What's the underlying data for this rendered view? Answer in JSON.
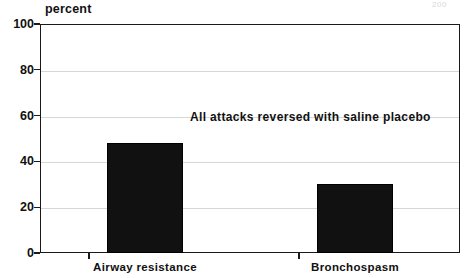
{
  "page_artifact": "200",
  "chart_data": {
    "type": "bar",
    "title": "",
    "subtitle": "",
    "xlabel": "",
    "ylabel": "percent",
    "ylim": [
      0,
      100
    ],
    "yticks": [
      0,
      20,
      40,
      60,
      80,
      100
    ],
    "ytick_labels": [
      "0",
      "20",
      "40",
      "60",
      "80",
      "100"
    ],
    "grid": "horizontal",
    "legend": "none",
    "categories": [
      "Airway resistance",
      "Bronchospasm"
    ],
    "values": [
      48,
      30
    ],
    "bar_color": "#111111",
    "annotations": [
      {
        "text": "All attacks reversed with saline placebo",
        "x": 190,
        "y": 110
      }
    ]
  }
}
